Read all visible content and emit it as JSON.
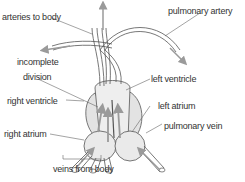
{
  "diagram": {
    "labels": {
      "arteries_to_body": "arteries to body",
      "pulmonary_artery": "pulmonary artery",
      "incomplete_division_1": "incomplete",
      "incomplete_division_2": "division",
      "left_ventricle": "left ventricle",
      "right_ventricle": "right ventricle",
      "left_atrium": "left atrium",
      "right_atrium": "right atrium",
      "pulmonary_vein": "pulmonary vein",
      "veins_from_body": "veins from body"
    },
    "colors": {
      "outline": "#555555",
      "fill": "#e8e8e8",
      "arrow": "#9a9a9a",
      "leader": "#666666",
      "text": "#333333"
    }
  }
}
